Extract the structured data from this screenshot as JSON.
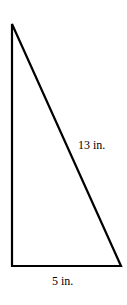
{
  "diagram": {
    "type": "right-triangle",
    "stroke_color": "#000000",
    "vertices": {
      "top": [
        12,
        24
      ],
      "bottom_left": [
        12,
        266
      ],
      "bottom_right": [
        121,
        266
      ]
    },
    "labels": {
      "hypotenuse": "13 in.",
      "base": "5 in."
    }
  }
}
